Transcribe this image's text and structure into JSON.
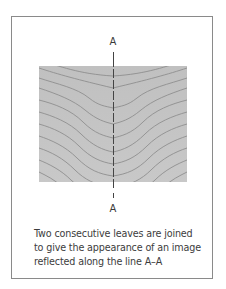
{
  "diagram": {
    "top_label": "A",
    "bottom_label": "A",
    "caption": "Two consecutive leaves are joined to give the appearance of an image reflected along the line A–A",
    "panel": {
      "description": "book-matched wood veneer grain, mirrored about vertical axis A–A",
      "fill_color": "#c4c4c4",
      "grain_color": "#8e8e8e",
      "axis_color": "#444444"
    }
  }
}
